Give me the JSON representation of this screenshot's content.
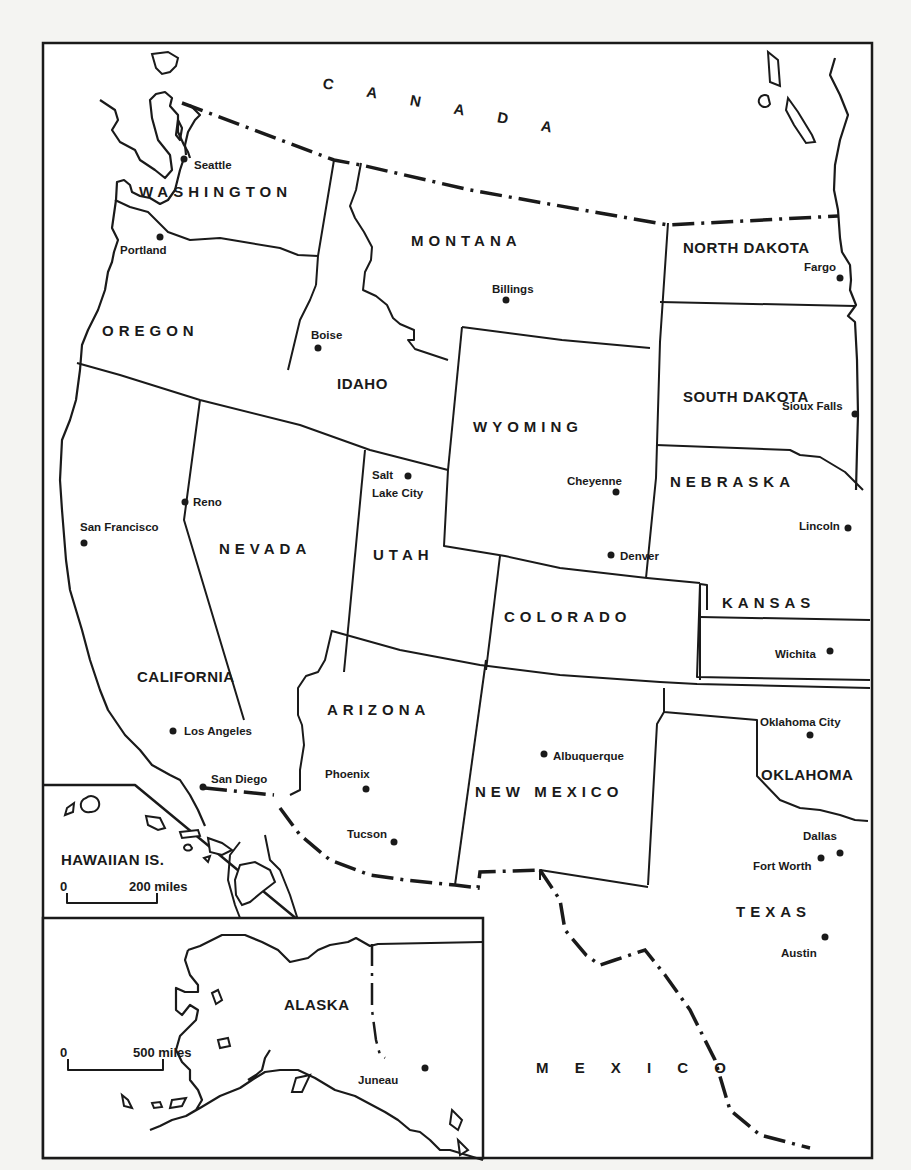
{
  "map": {
    "countries": {
      "canada": "C A N A D A",
      "mexico": "M E X I C O"
    },
    "states": {
      "washington": "WASHINGTON",
      "oregon": "OREGON",
      "california": "CALIFORNIA",
      "nevada": "NEVADA",
      "idaho": "IDAHO",
      "montana": "MONTANA",
      "wyoming": "WYOMING",
      "utah": "UTAH",
      "colorado": "COLORADO",
      "arizona": "ARIZONA",
      "new_mexico": "NEW MEXICO",
      "north_dakota": "NORTH DAKOTA",
      "south_dakota": "SOUTH DAKOTA",
      "nebraska": "NEBRASKA",
      "kansas": "KANSAS",
      "oklahoma": "OKLAHOMA",
      "texas": "TEXAS",
      "alaska": "ALASKA",
      "hawaii": "HAWAIIAN IS."
    },
    "cities": {
      "seattle": "Seattle",
      "portland": "Portland",
      "boise": "Boise",
      "billings": "Billings",
      "fargo": "Fargo",
      "sioux_falls": "Sioux Falls",
      "salt_lake_city_1": "Salt",
      "salt_lake_city_2": "Lake City",
      "cheyenne": "Cheyenne",
      "reno": "Reno",
      "san_francisco": "San Francisco",
      "denver": "Denver",
      "lincoln": "Lincoln",
      "wichita": "Wichita",
      "los_angeles": "Los Angeles",
      "san_diego": "San Diego",
      "phoenix": "Phoenix",
      "tucson": "Tucson",
      "albuquerque": "Albuquerque",
      "oklahoma_city": "Oklahoma City",
      "dallas": "Dallas",
      "fort_worth": "Fort Worth",
      "austin": "Austin",
      "juneau": "Juneau"
    },
    "scales": {
      "hawaii": {
        "zero": "0",
        "distance": "200 miles"
      },
      "alaska": {
        "zero": "0",
        "distance": "500 miles"
      }
    },
    "colors": {
      "ink": "#1a1a1a",
      "paper": "#ffffff",
      "bleed_through": "#d4d4d0"
    }
  }
}
